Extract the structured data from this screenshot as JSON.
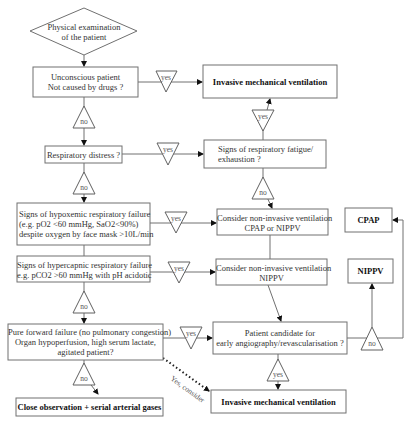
{
  "nodes": {
    "start": {
      "line1": "Physical examination",
      "line2": "of the patient"
    },
    "unconscious": {
      "line1": "Unconscious patient",
      "line2": "Not caused by drugs ?"
    },
    "invasive_top": {
      "label": "Invasive mechanical ventilation"
    },
    "respiratory_distress": {
      "label": "Respiratory distress ?"
    },
    "fatigue": {
      "line1": "Signs of respiratory fatigue/",
      "line2": "exhaustion ?"
    },
    "hypoxemic": {
      "line1": "Signs of hypoxemic respiratory failure",
      "line2": "(e.g. pO2 <60 mmHg, SaO2<90%)",
      "line3": "despite oxygen by face mask >10L/min"
    },
    "niv_cpap_nippv": {
      "line1": "Consider non-invasive ventilation",
      "line2": "CPAP or NIPPV"
    },
    "cpap": {
      "label": "CPAP"
    },
    "hypercapnic": {
      "line1": "Signs of hypercapnic respiratory failure",
      "line2": "e.g. pCO2 >60 mmHg  with pH acidotic"
    },
    "niv_nippv": {
      "line1": "Consider non-invasive ventilation",
      "line2": "NIPPV"
    },
    "nippv": {
      "label": "NIPPV"
    },
    "forward_failure": {
      "line1": "Pure forward failure (no pulmonary congestion)",
      "line2": "Organ hypoperfusion, high serum lactate,",
      "line3": "agitated patient?"
    },
    "angiography": {
      "line1": "Patient candidate for",
      "line2": "early angiography/revascularisation ?"
    },
    "close_observation": {
      "label": "Close observation + serial arterial gases"
    },
    "invasive_bottom": {
      "label": "Invasive mechanical ventilation"
    }
  },
  "decisions": {
    "yes": "yes",
    "no": "no",
    "yes_consider": "Yes, consider"
  }
}
